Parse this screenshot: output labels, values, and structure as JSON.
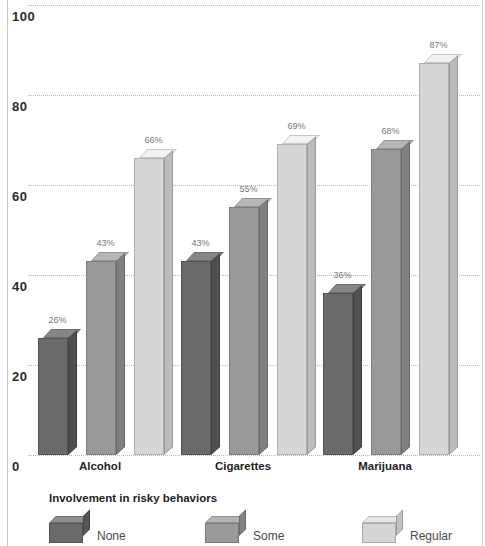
{
  "chart_data": {
    "type": "bar",
    "title": "",
    "subtitle": "",
    "xlabel": "",
    "ylabel": "",
    "ylim": [
      0,
      100
    ],
    "yticks": [
      "0",
      "20",
      "40",
      "60",
      "80",
      "100"
    ],
    "grid": true,
    "legend_position": "bottom",
    "legend_title": "Involvement in risky behaviors",
    "categories": [
      "Alcohol",
      "Cigarettes",
      "Marijuana"
    ],
    "series": [
      {
        "name": "None",
        "color": "#6a6a6a",
        "values": [
          26,
          43,
          36
        ],
        "labels": [
          "26%",
          "43%",
          "36%"
        ]
      },
      {
        "name": "Some",
        "color": "#9a9a9a",
        "values": [
          43,
          55,
          68
        ],
        "labels": [
          "43%",
          "55%",
          "68%"
        ]
      },
      {
        "name": "Regular",
        "color": "#d6d6d6",
        "values": [
          66,
          69,
          87
        ],
        "labels": [
          "66%",
          "69%",
          "87%"
        ]
      }
    ]
  },
  "legend": {
    "title": "Involvement in risky behaviors",
    "items": [
      {
        "label": "None",
        "color": "#6a6a6a"
      },
      {
        "label": "Some",
        "color": "#9a9a9a"
      },
      {
        "label": "Regular",
        "color": "#d6d6d6"
      }
    ]
  },
  "axis": {
    "y_ticks": [
      "100",
      "80",
      "60",
      "40",
      "20",
      "0"
    ]
  },
  "categories": [
    "Alcohol",
    "Cigarettes",
    "Marijuana"
  ]
}
